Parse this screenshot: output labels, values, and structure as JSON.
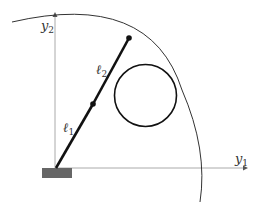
{
  "diagram": {
    "type": "two-link planar robot arm with workspace boundary and circular obstacle",
    "labels": {
      "axis_x": "y",
      "axis_x_sub": "1",
      "axis_y": "y",
      "axis_y_sub": "2",
      "link1": "ℓ",
      "link1_sub": "1",
      "link2": "ℓ",
      "link2_sub": "2"
    },
    "colors": {
      "link": "#111111",
      "axis": "#999999",
      "base": "#666666",
      "arc": "#333333",
      "obstacle": "#111111"
    }
  }
}
